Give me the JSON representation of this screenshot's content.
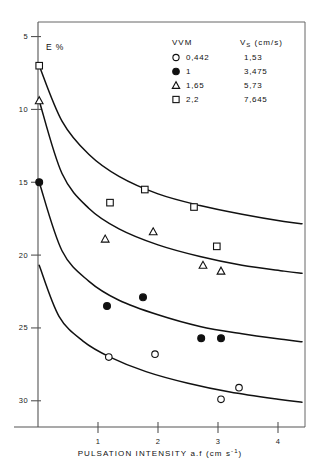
{
  "chart_data": {
    "type": "scatter",
    "title": "",
    "xlabel": "PULSATION INTENSITY a.f (cm s⁻¹)",
    "ylabel": "E %",
    "xlim": [
      0,
      4.45
    ],
    "ylim": [
      3.2,
      31.0
    ],
    "xticks": [
      1,
      2,
      3,
      4
    ],
    "yticks": [
      5,
      10,
      15,
      20,
      25,
      30
    ],
    "grid": false,
    "legend_position": "top-right",
    "legend_headers": [
      "VVM",
      "V_S (cm/s)"
    ],
    "series": [
      {
        "name": "0,442",
        "vvm": "0,442",
        "vs": "1,53",
        "marker": "open-circle",
        "points": [
          {
            "x": 1.18,
            "y": 8.0
          },
          {
            "x": 1.95,
            "y": 8.2
          },
          {
            "x": 3.05,
            "y": 5.1
          },
          {
            "x": 3.35,
            "y": 5.9
          }
        ],
        "curve": [
          {
            "x": 0.02,
            "y": 14.3
          },
          {
            "x": 0.35,
            "y": 10.8
          },
          {
            "x": 0.75,
            "y": 9.1
          },
          {
            "x": 1.2,
            "y": 8.0
          },
          {
            "x": 1.8,
            "y": 7.0
          },
          {
            "x": 2.5,
            "y": 6.2
          },
          {
            "x": 3.2,
            "y": 5.6
          },
          {
            "x": 4.0,
            "y": 5.1
          },
          {
            "x": 4.4,
            "y": 4.9
          }
        ]
      },
      {
        "name": "1",
        "vvm": "1",
        "vs": "3,475",
        "marker": "filled-circle",
        "points": [
          {
            "x": 0.02,
            "y": 20.0
          },
          {
            "x": 1.15,
            "y": 11.5
          },
          {
            "x": 1.75,
            "y": 12.1
          },
          {
            "x": 2.72,
            "y": 9.3
          },
          {
            "x": 3.05,
            "y": 9.3
          }
        ],
        "curve": [
          {
            "x": 0.02,
            "y": 20.0
          },
          {
            "x": 0.4,
            "y": 15.3
          },
          {
            "x": 0.85,
            "y": 13.2
          },
          {
            "x": 1.35,
            "y": 11.9
          },
          {
            "x": 2.0,
            "y": 10.9
          },
          {
            "x": 2.7,
            "y": 10.1
          },
          {
            "x": 3.4,
            "y": 9.6
          },
          {
            "x": 4.1,
            "y": 9.2
          },
          {
            "x": 4.4,
            "y": 9.05
          }
        ]
      },
      {
        "name": "1,65",
        "vvm": "1,65",
        "vs": "5,73",
        "marker": "open-triangle",
        "points": [
          {
            "x": 0.02,
            "y": 25.6
          },
          {
            "x": 1.12,
            "y": 16.1
          },
          {
            "x": 1.92,
            "y": 16.6
          },
          {
            "x": 2.75,
            "y": 14.3
          },
          {
            "x": 3.05,
            "y": 13.9
          }
        ],
        "curve": [
          {
            "x": 0.02,
            "y": 25.6
          },
          {
            "x": 0.4,
            "y": 20.6
          },
          {
            "x": 0.85,
            "y": 18.2
          },
          {
            "x": 1.35,
            "y": 16.8
          },
          {
            "x": 2.0,
            "y": 15.7
          },
          {
            "x": 2.7,
            "y": 14.9
          },
          {
            "x": 3.4,
            "y": 14.3
          },
          {
            "x": 4.1,
            "y": 13.9
          },
          {
            "x": 4.4,
            "y": 13.75
          }
        ]
      },
      {
        "name": "2,2",
        "vvm": "2,2",
        "vs": "7,645",
        "marker": "open-square",
        "points": [
          {
            "x": 0.02,
            "y": 28.0
          },
          {
            "x": 1.2,
            "y": 18.6
          },
          {
            "x": 1.78,
            "y": 19.5
          },
          {
            "x": 2.6,
            "y": 18.3
          },
          {
            "x": 2.98,
            "y": 15.6
          }
        ],
        "curve": [
          {
            "x": 0.02,
            "y": 28.0
          },
          {
            "x": 0.4,
            "y": 24.2
          },
          {
            "x": 0.85,
            "y": 21.9
          },
          {
            "x": 1.35,
            "y": 20.4
          },
          {
            "x": 2.0,
            "y": 19.2
          },
          {
            "x": 2.7,
            "y": 18.4
          },
          {
            "x": 3.4,
            "y": 17.8
          },
          {
            "x": 4.1,
            "y": 17.3
          },
          {
            "x": 4.4,
            "y": 17.15
          }
        ]
      }
    ]
  },
  "legend": {
    "header_left": "VVM",
    "header_right_main": "V",
    "header_right_sub": "S",
    "header_right_unit": "(cm/s)",
    "rows": [
      {
        "marker": "open-circle",
        "vvm": "0,442",
        "vs": "1,53"
      },
      {
        "marker": "filled-circle",
        "vvm": "1",
        "vs": "3,475"
      },
      {
        "marker": "open-triangle",
        "vvm": "1,65",
        "vs": "5,73"
      },
      {
        "marker": "open-square",
        "vvm": "2,2",
        "vs": "7,645"
      }
    ]
  },
  "axes": {
    "ylabel": "E %",
    "xtitle_main": "PULSATION INTENSITY a.f (cm s",
    "xtitle_sup": "-1",
    "xtitle_end": ")",
    "ytick_labels": [
      "30",
      "25",
      "20",
      "15",
      "10",
      "5"
    ],
    "xtick_labels": [
      "1",
      "2",
      "3",
      "4"
    ]
  },
  "caption": {
    "text": ""
  },
  "colors": {
    "ink": "#111111",
    "frame": "#666666",
    "background": "#ffffff"
  }
}
